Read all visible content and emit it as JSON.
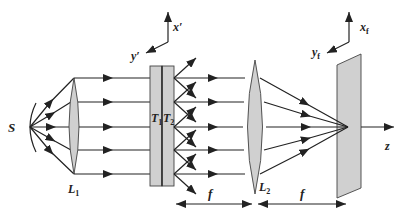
{
  "diagram": {
    "labels": {
      "source": "S",
      "lens1": "L",
      "lens1_sub": "1",
      "lens2": "L",
      "lens2_sub": "2",
      "plate1": "T",
      "plate1_sub": "1",
      "plate2": "T",
      "plate2_sub": "2",
      "axis_x_prime": "x′",
      "axis_y_prime": "y′",
      "axis_xf": "x",
      "axis_xf_sub": "f",
      "axis_yf": "y",
      "axis_yf_sub": "f",
      "axis_z": "z",
      "focal_length_1": "f",
      "focal_length_2": "f"
    },
    "colors": {
      "optic_fill": "#d0d0d0",
      "ray": "#222222",
      "background": "#ffffff"
    }
  }
}
